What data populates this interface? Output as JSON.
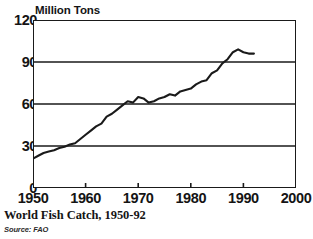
{
  "chart_data": {
    "type": "line",
    "title": "World Fish Catch, 1950-92",
    "subtitle": "Source: FAO",
    "ylabel": "Million Tons",
    "xlabel": "",
    "xlim": [
      1950,
      2000
    ],
    "ylim": [
      0,
      120
    ],
    "grid": "horizontal",
    "legend": "none",
    "yticks": [
      0,
      30,
      60,
      90,
      120
    ],
    "xticks": [
      1950,
      1960,
      1970,
      1980,
      1990,
      2000
    ],
    "ytick_labels": [
      "0",
      "30",
      "60",
      "90",
      "120"
    ],
    "xtick_labels": [
      "1950",
      "1960",
      "1970",
      "1980",
      "1990",
      "2000"
    ],
    "line_color": "#1a1a1a",
    "series": [
      {
        "name": "World Fish Catch",
        "x": [
          1950,
          1951,
          1952,
          1953,
          1954,
          1955,
          1956,
          1957,
          1958,
          1959,
          1960,
          1961,
          1962,
          1963,
          1964,
          1965,
          1966,
          1967,
          1968,
          1969,
          1970,
          1971,
          1972,
          1973,
          1974,
          1975,
          1976,
          1977,
          1978,
          1979,
          1980,
          1981,
          1982,
          1983,
          1984,
          1985,
          1986,
          1987,
          1988,
          1989,
          1990,
          1991,
          1992
        ],
        "values": [
          21,
          23,
          25,
          26,
          27,
          28.5,
          29.5,
          31,
          32,
          35,
          38,
          41,
          44,
          46,
          51,
          53,
          56,
          59,
          62,
          61,
          65,
          64,
          61,
          62,
          64,
          65,
          67,
          66,
          69,
          70,
          71,
          74,
          76,
          77,
          82,
          84,
          89,
          92,
          97,
          99,
          97,
          96,
          96
        ]
      }
    ]
  },
  "axis_title": {
    "text": "Million Tons"
  },
  "caption": {
    "title": "World Fish Catch, 1950-92",
    "source": "Source: FAO"
  }
}
